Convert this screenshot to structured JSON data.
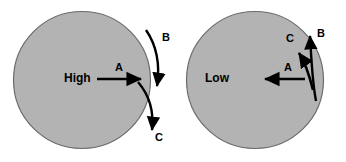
{
  "figure": {
    "type": "schematic-diagram",
    "background_color": "#ffffff",
    "circle_fill": "#b3b3b3",
    "circle_stroke": "#6b6b6b",
    "arrow_color": "#000000",
    "panels": [
      {
        "id": "left",
        "state_label": "High",
        "circle": {
          "cx": 82,
          "cy": 80,
          "r": 69
        },
        "arrows": [
          {
            "id": "A",
            "label": "A",
            "shape": "straight",
            "direction": "right",
            "location": "inside-circle",
            "from": {
              "x": 97,
              "y": 79
            },
            "to": {
              "x": 145,
              "y": 79
            },
            "label_pos": {
              "x": 118,
              "y": 63
            }
          },
          {
            "id": "B",
            "label": "B",
            "shape": "curved",
            "direction": "down",
            "location": "outside-right",
            "from": {
              "x": 146,
              "y": 30
            },
            "to": {
              "x": 158,
              "y": 90
            },
            "label_pos": {
              "x": 163,
              "y": 34
            }
          },
          {
            "id": "C",
            "label": "C",
            "shape": "curved",
            "direction": "down",
            "location": "crossing-boundary",
            "from": {
              "x": 139,
              "y": 83
            },
            "to": {
              "x": 152,
              "y": 134
            },
            "label_pos": {
              "x": 155,
              "y": 134
            }
          }
        ]
      },
      {
        "id": "right",
        "state_label": "Low",
        "circle": {
          "cx": 255,
          "cy": 80,
          "r": 69
        },
        "arrows": [
          {
            "id": "A",
            "label": "A",
            "shape": "straight",
            "direction": "left",
            "location": "inside-circle",
            "from": {
              "x": 305,
              "y": 79
            },
            "to": {
              "x": 262,
              "y": 79
            },
            "label_pos": {
              "x": 286,
              "y": 63
            }
          },
          {
            "id": "B",
            "label": "B",
            "shape": "curved",
            "direction": "up",
            "location": "outside-right",
            "from": {
              "x": 316,
              "y": 101
            },
            "to": {
              "x": 309,
              "y": 32
            },
            "label_pos": {
              "x": 318,
              "y": 31
            }
          },
          {
            "id": "C",
            "label": "C",
            "shape": "curved",
            "direction": "up-left",
            "location": "crossing-boundary",
            "from": {
              "x": 313,
              "y": 90
            },
            "to": {
              "x": 296,
              "y": 48
            },
            "label_pos": {
              "x": 287,
              "y": 36
            }
          }
        ]
      }
    ]
  },
  "labels": {
    "left_state": "High",
    "left_a": "A",
    "left_b": "B",
    "left_c": "C",
    "right_state": "Low",
    "right_a": "A",
    "right_b": "B",
    "right_c": "C"
  }
}
